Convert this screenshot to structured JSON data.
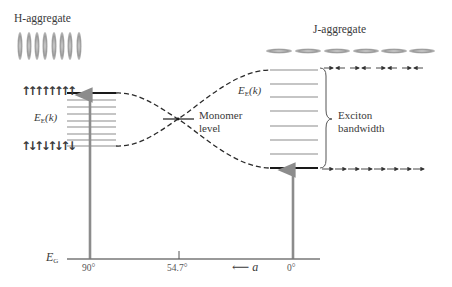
{
  "h_aggregate": {
    "label": "H-aggregate",
    "molecule_orientation": "vertical",
    "molecule_count": 8,
    "top_level_dipoles": "↑↑↑↑↑↑↑↑",
    "bottom_level_dipoles": "↑↓↑↓↑↓↑↓",
    "band_label_main": "E",
    "band_label_sub": "E",
    "band_label_arg": "(k)",
    "angle_label": "90°"
  },
  "j_aggregate": {
    "label": "J-aggregate",
    "molecule_orientation": "horizontal",
    "molecule_count": 6,
    "top_level_dipoles": "→← →← →← →←",
    "bottom_level_dipoles": "→→→→→→→→",
    "band_label_main": "E",
    "band_label_sub": "E",
    "band_label_arg": "(k)",
    "angle_label": "0°"
  },
  "monomer": {
    "label_line1": "Monomer",
    "label_line2": "level",
    "angle_label": "54.7°"
  },
  "bandwidth": {
    "label_line1": "Exciton",
    "label_line2": "bandwidth"
  },
  "ground_state": {
    "label_main": "E",
    "label_sub": "G"
  },
  "axis": {
    "direction_arrow": "⟵",
    "variable": "a"
  },
  "colors": {
    "allowed_transition": "#8c8c8c",
    "band_levels": "#8c8c8c",
    "bright_level": "#1a1a1a",
    "dashed_curve": "#2a2a2a",
    "molecules": "#9a9a9a"
  }
}
